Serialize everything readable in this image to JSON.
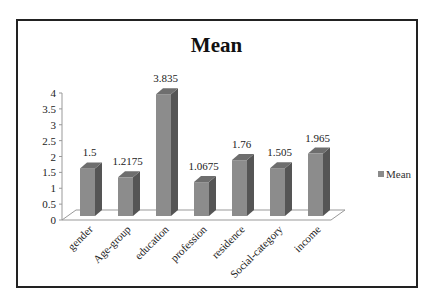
{
  "chart_data": {
    "type": "bar",
    "title": "Mean",
    "categories": [
      "gender",
      "Age-group",
      "education",
      "profession",
      "residence",
      "Social-category",
      "income"
    ],
    "series": [
      {
        "name": "Mean",
        "values": [
          1.5,
          1.2175,
          3.835,
          1.0675,
          1.76,
          1.505,
          1.965
        ]
      }
    ],
    "data_labels": [
      "1.5",
      "1.2175",
      "3.835",
      "1.0675",
      "1.76",
      "1.505",
      "1.965"
    ],
    "xlabel": "",
    "ylabel": "",
    "ylim": [
      0,
      4
    ],
    "yticks": [
      "0",
      "0.5",
      "1",
      "1.5",
      "2",
      "2.5",
      "3",
      "3.5",
      "4"
    ],
    "grid": false,
    "legend_position": "right",
    "style": "3d-column",
    "bar_color": "#8a8a8a"
  },
  "legend": {
    "label": "Mean"
  }
}
